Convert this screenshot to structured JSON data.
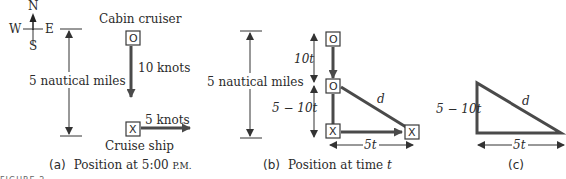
{
  "compass": {
    "n": "N",
    "s": "S",
    "e": "E",
    "w": "W"
  },
  "panel_a": {
    "distance_label": "5 nautical miles",
    "cabin_cruiser_label": "Cabin cruiser",
    "cabin_cruiser_symbol": "O",
    "cabin_cruiser_speed": "10 knots",
    "cruise_ship_label": "Cruise ship",
    "cruise_ship_symbol": "X",
    "cruise_ship_speed": "5 knots",
    "caption_letter": "(a)",
    "caption_text": "Position at 5:00 ",
    "caption_pm": "P.M."
  },
  "panel_b": {
    "distance_label": "5 nautical miles",
    "upper_segment": "10t",
    "lower_segment": "5 − 10t",
    "hypotenuse": "d",
    "base": "5t",
    "cruiser_symbol": "O",
    "ship_symbol": "X",
    "caption_letter": "(b)",
    "caption_text": "Position at time ",
    "caption_var": "t"
  },
  "panel_c": {
    "vertical": "5 − 10t",
    "hypotenuse": "d",
    "base": "5t",
    "caption_letter": "(c)"
  },
  "figure_label": "FIGURE 2"
}
